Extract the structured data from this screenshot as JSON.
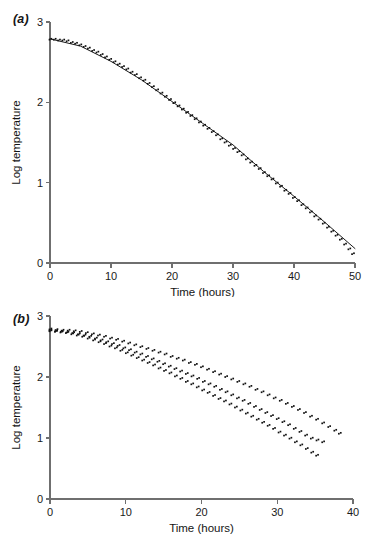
{
  "figure": {
    "panels": [
      {
        "id": "a",
        "label": "(a)"
      },
      {
        "id": "b",
        "label": "(b)"
      }
    ]
  },
  "chart_data": [
    {
      "type": "scatter",
      "panel": "(a)",
      "title": "",
      "xlabel": "Time (hours)",
      "ylabel": "Log temperature",
      "xlim": [
        0,
        50
      ],
      "ylim": [
        0,
        3
      ],
      "xticks": [
        0,
        10,
        20,
        30,
        40,
        50
      ],
      "yticks": [
        0,
        1,
        2,
        3
      ],
      "xtick_labels": [
        "0",
        "10",
        "20",
        "30",
        "40",
        "50"
      ],
      "ytick_labels": [
        "0",
        "1",
        "2",
        "3"
      ],
      "grid": false,
      "legend": "none",
      "series": [
        {
          "name": "cooling-curve",
          "marker": "filled-square",
          "x": [
            0.0,
            0.7,
            1.4,
            2.1,
            2.8,
            3.5,
            4.2,
            4.9,
            5.6,
            6.3,
            7.0,
            7.7,
            8.4,
            9.1,
            9.8,
            10.5,
            11.2,
            11.9,
            12.6,
            13.3,
            14.0,
            14.7,
            15.4,
            16.1,
            16.8,
            17.5,
            18.2,
            18.9,
            19.6,
            20.3,
            21.0,
            21.7,
            22.4,
            23.1,
            23.8,
            24.5,
            25.2,
            25.9,
            26.6,
            27.3,
            28.0,
            28.7,
            29.4,
            30.1,
            30.8,
            31.5,
            32.2,
            32.9,
            33.6,
            34.3,
            35.0,
            35.7,
            36.4,
            37.1,
            37.8,
            38.5,
            39.2,
            39.9,
            40.6,
            41.3,
            42.0,
            42.7,
            43.4,
            44.1,
            44.8,
            45.5,
            46.2,
            46.9,
            47.6,
            48.3,
            49.0,
            49.6
          ],
          "y": [
            2.78,
            2.78,
            2.77,
            2.77,
            2.76,
            2.74,
            2.73,
            2.71,
            2.69,
            2.67,
            2.64,
            2.62,
            2.59,
            2.56,
            2.53,
            2.5,
            2.47,
            2.44,
            2.41,
            2.37,
            2.34,
            2.3,
            2.27,
            2.23,
            2.19,
            2.15,
            2.11,
            2.07,
            2.03,
            1.99,
            1.95,
            1.91,
            1.87,
            1.83,
            1.79,
            1.75,
            1.71,
            1.67,
            1.63,
            1.59,
            1.54,
            1.5,
            1.46,
            1.42,
            1.38,
            1.34,
            1.29,
            1.25,
            1.21,
            1.17,
            1.12,
            1.08,
            1.04,
            0.99,
            0.95,
            0.9,
            0.86,
            0.81,
            0.77,
            0.72,
            0.68,
            0.63,
            0.58,
            0.54,
            0.49,
            0.44,
            0.39,
            0.34,
            0.29,
            0.23,
            0.17,
            0.11
          ]
        }
      ],
      "fit_line": {
        "name": "fitted-curve",
        "x": [
          0.0,
          5.0,
          10.0,
          15.0,
          20.0,
          25.0,
          30.0,
          35.0,
          40.0,
          45.0,
          50.0
        ],
        "y": [
          2.79,
          2.7,
          2.51,
          2.28,
          2.01,
          1.74,
          1.47,
          1.14,
          0.83,
          0.51,
          0.18
        ]
      }
    },
    {
      "type": "scatter",
      "panel": "(b)",
      "title": "",
      "xlabel": "Time (hours)",
      "ylabel": "Log temperature",
      "xlim": [
        0,
        40
      ],
      "ylim": [
        0,
        3
      ],
      "xticks": [
        0,
        10,
        20,
        30,
        40
      ],
      "yticks": [
        0,
        1,
        2,
        3
      ],
      "xtick_labels": [
        "0",
        "10",
        "20",
        "30",
        "40"
      ],
      "ytick_labels": [
        "0",
        "1",
        "2",
        "3"
      ],
      "grid": false,
      "legend": "none",
      "series": [
        {
          "name": "series-slow-cooling",
          "marker": "filled-square",
          "x": [
            0.0,
            0.8,
            1.6,
            2.4,
            3.2,
            4.0,
            4.8,
            5.6,
            6.4,
            7.2,
            8.0,
            8.8,
            9.6,
            10.4,
            11.2,
            12.0,
            12.8,
            13.6,
            14.4,
            15.2,
            16.0,
            16.8,
            17.6,
            18.4,
            19.2,
            20.0,
            20.8,
            21.6,
            22.4,
            23.2,
            24.0,
            24.8,
            25.6,
            26.4,
            27.2,
            28.0,
            28.8,
            29.6,
            30.4,
            31.2,
            32.0,
            32.8,
            33.6,
            34.4,
            35.2,
            36.0,
            36.8,
            37.6,
            38.2
          ],
          "y": [
            2.78,
            2.77,
            2.76,
            2.76,
            2.75,
            2.74,
            2.72,
            2.7,
            2.68,
            2.66,
            2.63,
            2.61,
            2.58,
            2.55,
            2.52,
            2.49,
            2.46,
            2.43,
            2.4,
            2.37,
            2.33,
            2.3,
            2.27,
            2.23,
            2.2,
            2.16,
            2.12,
            2.08,
            2.04,
            2.0,
            1.96,
            1.92,
            1.88,
            1.84,
            1.79,
            1.75,
            1.7,
            1.65,
            1.61,
            1.56,
            1.51,
            1.46,
            1.41,
            1.35,
            1.3,
            1.24,
            1.18,
            1.12,
            1.07
          ]
        },
        {
          "name": "series-medium-cooling",
          "marker": "filled-square",
          "x": [
            0.0,
            0.75,
            1.5,
            2.25,
            3.0,
            3.75,
            4.5,
            5.25,
            6.0,
            6.75,
            7.5,
            8.25,
            9.0,
            9.75,
            10.5,
            11.25,
            12.0,
            12.75,
            13.5,
            14.25,
            15.0,
            15.75,
            16.5,
            17.25,
            18.0,
            18.75,
            19.5,
            20.25,
            21.0,
            21.75,
            22.5,
            23.25,
            24.0,
            24.75,
            25.5,
            26.25,
            27.0,
            27.75,
            28.5,
            29.25,
            30.0,
            30.75,
            31.5,
            32.25,
            33.0,
            33.75,
            34.5,
            35.25,
            36.0
          ],
          "y": [
            2.76,
            2.75,
            2.74,
            2.73,
            2.72,
            2.7,
            2.68,
            2.66,
            2.63,
            2.6,
            2.57,
            2.54,
            2.51,
            2.47,
            2.44,
            2.4,
            2.37,
            2.33,
            2.29,
            2.25,
            2.21,
            2.17,
            2.13,
            2.09,
            2.05,
            2.01,
            1.97,
            1.92,
            1.88,
            1.84,
            1.79,
            1.75,
            1.7,
            1.65,
            1.61,
            1.56,
            1.51,
            1.46,
            1.41,
            1.36,
            1.31,
            1.26,
            1.21,
            1.15,
            1.1,
            1.04,
            0.99,
            0.96,
            0.93
          ]
        },
        {
          "name": "series-fast-cooling",
          "marker": "filled-square",
          "x": [
            0.0,
            0.72,
            1.44,
            2.16,
            2.88,
            3.6,
            4.32,
            5.04,
            5.76,
            6.48,
            7.2,
            7.92,
            8.64,
            9.36,
            10.08,
            10.8,
            11.52,
            12.24,
            12.96,
            13.68,
            14.4,
            15.12,
            15.84,
            16.56,
            17.28,
            18.0,
            18.72,
            19.44,
            20.16,
            20.88,
            21.6,
            22.32,
            23.04,
            23.76,
            24.48,
            25.2,
            25.92,
            26.64,
            27.36,
            28.08,
            28.8,
            29.52,
            30.24,
            30.96,
            31.68,
            32.4,
            33.12,
            33.84,
            34.56,
            35.2
          ],
          "y": [
            2.75,
            2.74,
            2.73,
            2.72,
            2.7,
            2.68,
            2.66,
            2.63,
            2.6,
            2.57,
            2.54,
            2.5,
            2.47,
            2.43,
            2.39,
            2.35,
            2.31,
            2.27,
            2.23,
            2.19,
            2.14,
            2.1,
            2.06,
            2.01,
            1.97,
            1.92,
            1.88,
            1.83,
            1.78,
            1.74,
            1.69,
            1.64,
            1.6,
            1.55,
            1.5,
            1.45,
            1.4,
            1.35,
            1.3,
            1.25,
            1.2,
            1.15,
            1.09,
            1.04,
            0.99,
            0.93,
            0.88,
            0.82,
            0.76,
            0.71
          ]
        }
      ]
    }
  ]
}
